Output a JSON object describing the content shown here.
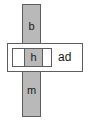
{
  "diagram": {
    "vertical_bar": {
      "top_label": "b",
      "bottom_label": "m",
      "fill_color": "#b9b9b9",
      "stroke_color": "#5e5e5e"
    },
    "horizontal_box": {
      "fill_color": "#ffffff",
      "stroke_color": "#5e5e5e",
      "side_label": "ad",
      "inner_box": {
        "cell_label": "h",
        "cell_fill_color": "#b9b9b9",
        "stroke_color": "#5e5e5e"
      }
    }
  }
}
